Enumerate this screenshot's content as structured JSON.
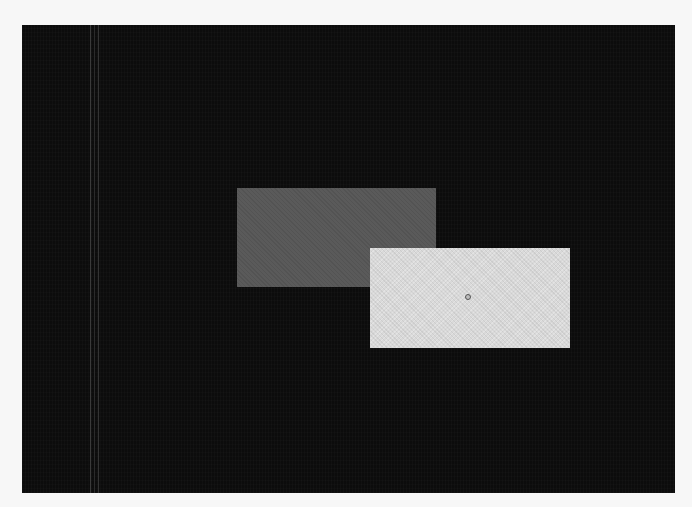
{
  "canvas": {
    "background_color": "#0c0c0c",
    "page_background": "#f7f7f7"
  },
  "shapes": [
    {
      "name": "dark-rectangle",
      "color": "#5a5a5a"
    },
    {
      "name": "light-rectangle",
      "color": "#d9d9d9"
    }
  ],
  "cursor": {
    "icon": "circle-handle-icon"
  }
}
